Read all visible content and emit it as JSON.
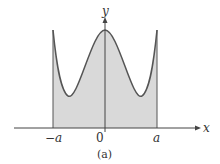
{
  "figure": {
    "caption": "(a)",
    "axes": {
      "x_label": "x",
      "y_label": "y",
      "origin_label": "0",
      "tick_left": "−a",
      "tick_right": "a"
    },
    "colors": {
      "curve": "#555555",
      "fill": "#d9d9d9",
      "axis": "#444444"
    }
  }
}
